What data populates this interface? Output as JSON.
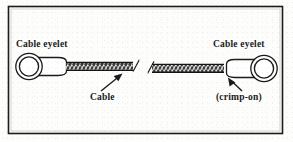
{
  "figure": {
    "border_color": "#1c1c1c",
    "line_color": "#1b1b1b",
    "cable_color": "#2a2a2a",
    "background_color": "#fdfdfc",
    "labels": {
      "eyelet_left": "Cable eyelet",
      "eyelet_right": "Cable eyelet",
      "cable": "Cable",
      "crimp": "(crimp-on)"
    },
    "annotations": [
      {
        "name": "leader-arrow-cable",
        "label": "Cable",
        "points_to": "cable-body",
        "direction": "up-right"
      },
      {
        "name": "leader-arrow-crimp",
        "label": "(crimp-on)",
        "points_to": "eyelet-right-barrel",
        "direction": "up-left"
      }
    ],
    "parts": [
      {
        "name": "eyelet-left",
        "type": "ring-with-barrel",
        "label": "Cable eyelet"
      },
      {
        "name": "cable-body",
        "type": "braided-cable",
        "label": "Cable"
      },
      {
        "name": "break-symbol",
        "type": "break",
        "label": ""
      },
      {
        "name": "eyelet-right",
        "type": "ring-with-barrel",
        "label": "Cable eyelet"
      }
    ]
  }
}
